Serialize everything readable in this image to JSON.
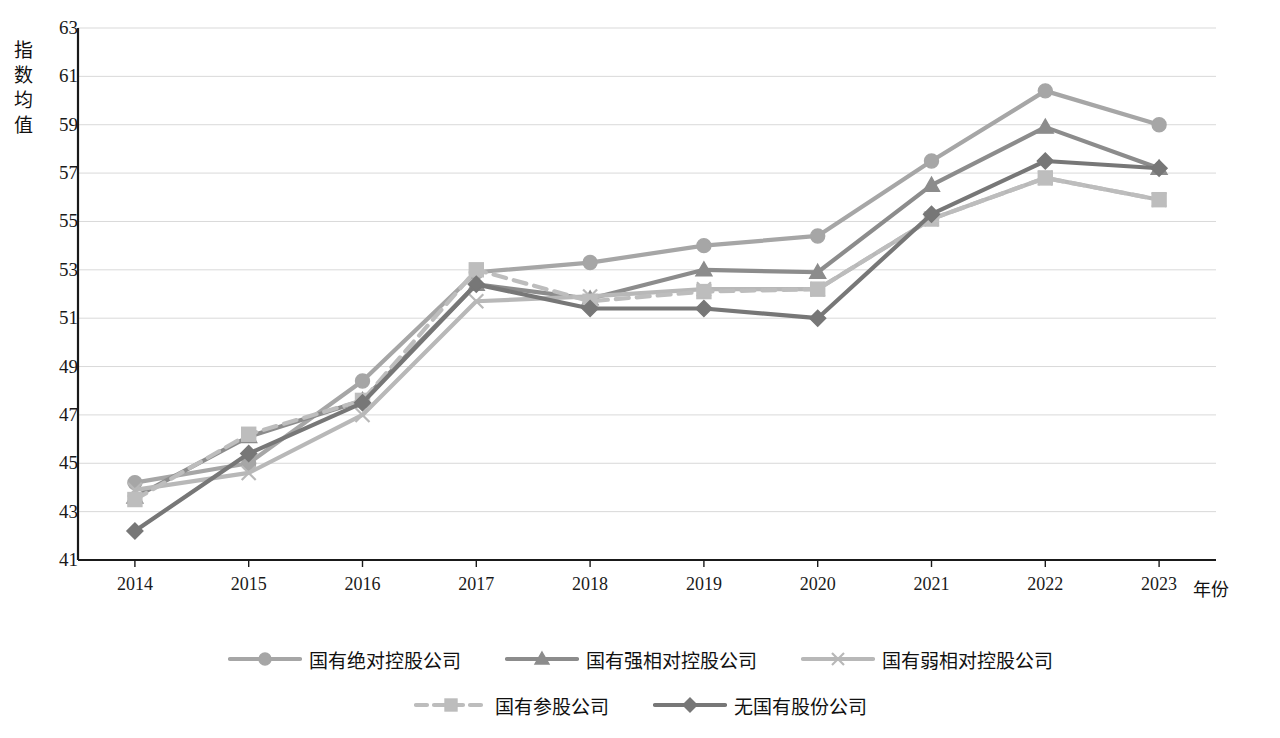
{
  "chart_data": {
    "type": "line",
    "title": "",
    "xlabel": "年份",
    "ylabel": "指数均值",
    "categories": [
      "2014",
      "2015",
      "2016",
      "2017",
      "2018",
      "2019",
      "2020",
      "2021",
      "2022",
      "2023"
    ],
    "ylim": [
      41,
      63
    ],
    "ytick_step": 2,
    "yticks": [
      41,
      43,
      45,
      47,
      49,
      51,
      53,
      55,
      57,
      59,
      61,
      63
    ],
    "grid": true,
    "legend_position": "bottom",
    "series": [
      {
        "name": "国有绝对控股公司",
        "marker": "circle",
        "line_style": "solid",
        "color": "#a6a6a6",
        "values": [
          44.2,
          45.0,
          48.4,
          52.9,
          53.3,
          54.0,
          54.4,
          57.5,
          60.4,
          59.0
        ]
      },
      {
        "name": "国有强相对控股公司",
        "marker": "triangle",
        "line_style": "solid",
        "color": "#8c8c8c",
        "values": [
          43.6,
          46.1,
          47.6,
          52.4,
          51.8,
          53.0,
          52.9,
          56.5,
          58.9,
          57.2
        ]
      },
      {
        "name": "国有弱相对控股公司",
        "marker": "cross",
        "line_style": "solid",
        "color": "#b8b8b8",
        "values": [
          43.9,
          44.6,
          47.0,
          51.7,
          51.9,
          52.2,
          52.2,
          55.1,
          56.8,
          55.9
        ]
      },
      {
        "name": "国有参股公司",
        "marker": "square",
        "line_style": "dashed",
        "color": "#bdbdbd",
        "values": [
          43.5,
          46.2,
          47.6,
          53.0,
          51.7,
          52.1,
          52.2,
          55.1,
          56.8,
          55.9
        ]
      },
      {
        "name": "无国有股份公司",
        "marker": "diamond",
        "line_style": "solid",
        "color": "#777777",
        "values": [
          42.2,
          45.4,
          47.5,
          52.4,
          51.4,
          51.4,
          51.0,
          55.3,
          57.5,
          57.2
        ]
      }
    ]
  },
  "axis": {
    "y_title_chars": [
      "指",
      "数",
      "均",
      "值"
    ],
    "x_title": "年份"
  },
  "legend": {
    "items": [
      {
        "label": "国有绝对控股公司"
      },
      {
        "label": "国有强相对控股公司"
      },
      {
        "label": "国有弱相对控股公司"
      },
      {
        "label": "国有参股公司"
      },
      {
        "label": "无国有股份公司"
      }
    ]
  },
  "colors": {
    "axis_line": "#1a1a1a",
    "gridline": "#d9d9d9",
    "background": "#ffffff"
  }
}
